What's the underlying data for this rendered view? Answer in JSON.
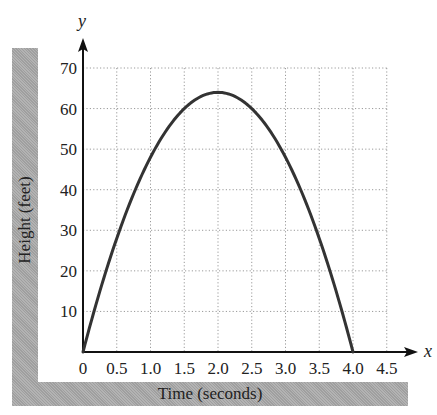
{
  "chart_data": {
    "type": "line",
    "title": "",
    "xlabel": "Time (seconds)",
    "ylabel": "Height (feet)",
    "x_axis_symbol": "x",
    "y_axis_symbol": "y",
    "xlim": [
      0,
      4.5
    ],
    "ylim": [
      0,
      70
    ],
    "x_ticks": [
      0,
      0.5,
      1.0,
      1.5,
      2.0,
      2.5,
      3.0,
      3.5,
      4.0,
      4.5
    ],
    "x_tick_labels": [
      "0",
      "0.5",
      "1.0",
      "1.5",
      "2.0",
      "2.5",
      "3.0",
      "3.5",
      "4.0",
      "4.5"
    ],
    "y_ticks": [
      10,
      20,
      30,
      40,
      50,
      60,
      70
    ],
    "y_tick_labels": [
      "10",
      "20",
      "30",
      "40",
      "50",
      "60",
      "70"
    ],
    "grid": true,
    "grid_style": "dotted",
    "legend": null,
    "series": [
      {
        "name": "Height",
        "equation": "h = 64t - 16t^2",
        "x": [
          0,
          0.25,
          0.5,
          0.75,
          1.0,
          1.25,
          1.5,
          1.75,
          2.0,
          2.25,
          2.5,
          2.75,
          3.0,
          3.25,
          3.5,
          3.75,
          4.0
        ],
        "values": [
          0,
          15,
          28,
          39,
          48,
          55,
          60,
          63,
          64,
          63,
          60,
          55,
          48,
          39,
          28,
          15,
          0
        ],
        "color": "#333333"
      }
    ],
    "colors": {
      "curve": "#333333",
      "axis": "#111111",
      "grid": "#9a9a9a",
      "label_bars": "#a9a9a9"
    }
  }
}
